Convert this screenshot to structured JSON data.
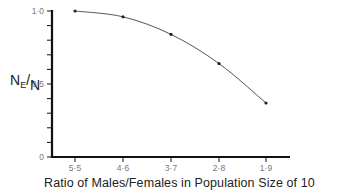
{
  "chart_data": {
    "type": "line",
    "title": "",
    "xlabel": "Ratio of Males/Females in Population Size of 10",
    "ylabel": "NE/N",
    "ylabel_parts": {
      "main": "N",
      "sub": "E",
      "denominator": "N"
    },
    "categories": [
      "5:5",
      "4:6",
      "3:7",
      "2:8",
      "1:9"
    ],
    "x_tick_labels": [
      "5·5",
      "4·6",
      "3·7",
      "2·8",
      "1·9"
    ],
    "values": [
      1.0,
      0.96,
      0.84,
      0.64,
      0.37
    ],
    "y_ticks": [
      0,
      0.1,
      0.2,
      0.3,
      0.4,
      0.5,
      0.6,
      0.7,
      0.8,
      0.9,
      1.0
    ],
    "y_tick_labels": {
      "0": "0",
      "0.5": "0·5",
      "1.0": "1·0"
    },
    "ylim": [
      0,
      1.0
    ],
    "grid": false,
    "legend": null,
    "markers": true,
    "smooth_curve": true
  }
}
